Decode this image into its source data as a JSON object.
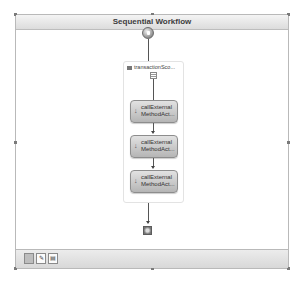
{
  "workflow": {
    "title": "Sequential Workflow",
    "start_icon": "start-node-icon",
    "end_icon": "end-node-icon",
    "scope": {
      "label": "transactionSco...",
      "activities": [
        {
          "label_line1": "callExternal",
          "label_line2": "MethodAct..."
        },
        {
          "label_line1": "callExternal",
          "label_line2": "MethodAct..."
        },
        {
          "label_line1": "callExternal",
          "label_line2": "MethodAct..."
        }
      ]
    }
  },
  "footer": {
    "views": [
      {
        "name": "workflow-view",
        "glyph": "",
        "active": true
      },
      {
        "name": "cancel-handler-view",
        "glyph": "✎",
        "active": false
      },
      {
        "name": "fault-handler-view",
        "glyph": "▤",
        "active": false
      }
    ]
  }
}
